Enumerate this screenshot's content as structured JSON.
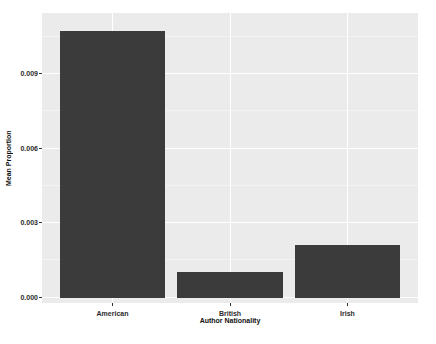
{
  "chart_data": {
    "type": "bar",
    "title": "",
    "xlabel": "Author Nationality",
    "ylabel": "Mean Proportion",
    "categories": [
      "American",
      "British",
      "Irish"
    ],
    "values": [
      0.0107,
      0.001,
      0.0021
    ],
    "ylim": [
      0,
      0.0114
    ],
    "yticks": [
      0,
      0.003,
      0.006,
      0.009
    ],
    "ytick_labels": [
      "0.000",
      "0.003",
      "0.006",
      "0.009"
    ],
    "minor_yticks": [
      0.0015,
      0.0045,
      0.0075,
      0.0105
    ],
    "grid": "major-and-minor",
    "legend_position": "none",
    "bar_width_fraction": 0.9,
    "colors": {
      "bar_fill": "#3b3b3b",
      "panel_background": "#ebebeb",
      "major_grid": "#ffffff",
      "minor_grid": "#f4f4f4",
      "tick_mark": "#333333",
      "tick_text": "#2b2b2b",
      "figure_background": "#ffffff"
    }
  }
}
